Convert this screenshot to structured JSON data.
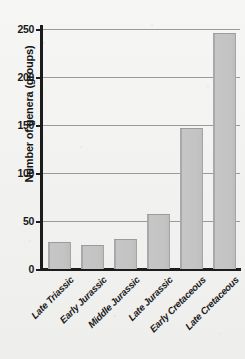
{
  "chart_data": {
    "type": "bar",
    "title": "",
    "subtitle": "",
    "xlabel": "",
    "ylabel": "Number of genera (groups)",
    "categories": [
      "Late Triassic",
      "Early Jurassic",
      "Middle Jurassic",
      "Late Jurassic",
      "Early Cretaceous",
      "Late Cretaceous"
    ],
    "values": [
      28,
      25,
      31,
      57,
      147,
      246
    ],
    "ylim": [
      0,
      250
    ],
    "ytick_labels": [
      "0",
      "50",
      "100",
      "150",
      "200",
      "250"
    ],
    "ytick_values": [
      0,
      50,
      100,
      150,
      200,
      250
    ],
    "grid": true,
    "grid_axis": "y",
    "legend": false,
    "legend_position": "none",
    "bar_color": "#c3c3c3",
    "bar_edge_color": "#9c9c9c",
    "axis_color": "#1c1c1c",
    "gridline_color": "#9a9a9a",
    "background_color": "#f3f3f1",
    "text_color": "#1a1a1a",
    "xtick_label_rotation": -45
  },
  "axes": {
    "y_axis_name": "y-axis",
    "x_axis_name": "x-axis"
  }
}
